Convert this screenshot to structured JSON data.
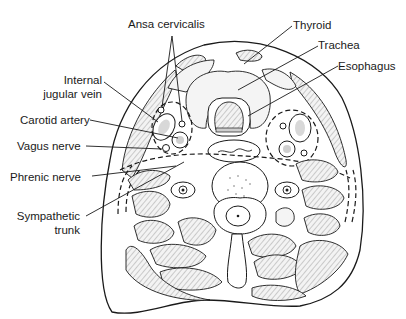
{
  "figure": {
    "labels": {
      "ansa_cervicalis": "Ansa cervicalis",
      "thyroid": "Thyroid",
      "trachea": "Trachea",
      "esophagus": "Esophagus",
      "internal_jugular_vein_line1": "Internal",
      "internal_jugular_vein_line2": "jugular vein",
      "carotid_artery": "Carotid artery",
      "vagus_nerve": "Vagus nerve",
      "phrenic_nerve": "Phrenic nerve",
      "sympathetic_trunk_line1": "Sympathetic",
      "sympathetic_trunk_line2": "trunk"
    },
    "colors": {
      "line": "#1a1a1a",
      "background": "#ffffff"
    }
  }
}
